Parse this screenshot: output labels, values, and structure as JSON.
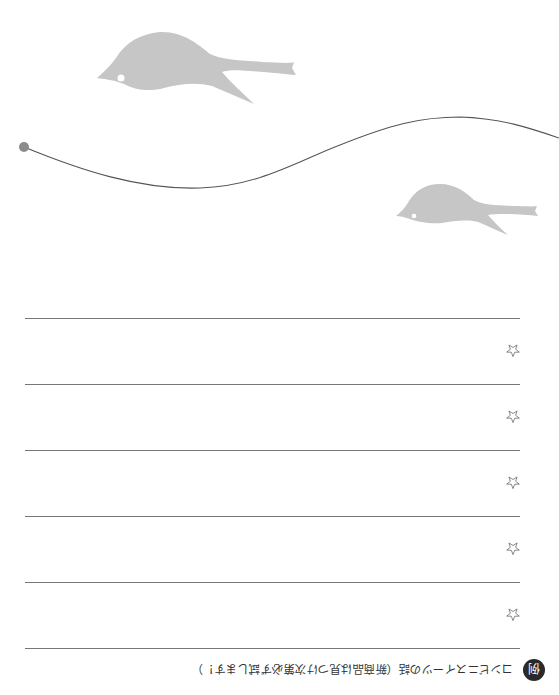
{
  "decorations": {
    "birds": [
      {
        "name": "large-bird",
        "color": "#c4c4c4"
      },
      {
        "name": "small-bird",
        "color": "#c4c4c4"
      }
    ],
    "curve_color": "#555555",
    "dot_color": "#8c8c8c"
  },
  "lines": {
    "count": 6,
    "y_positions": [
      318,
      384,
      450,
      516,
      582,
      648
    ],
    "color": "#777777"
  },
  "rows": [
    {
      "marker": "☆"
    },
    {
      "marker": "☆"
    },
    {
      "marker": "☆"
    },
    {
      "marker": "☆"
    },
    {
      "marker": "☆"
    }
  ],
  "caption": {
    "badge": "例",
    "text": "コンビニスイーツの話（新商品は見つけ次第必ず試します！）",
    "orientation": "upside-down"
  }
}
